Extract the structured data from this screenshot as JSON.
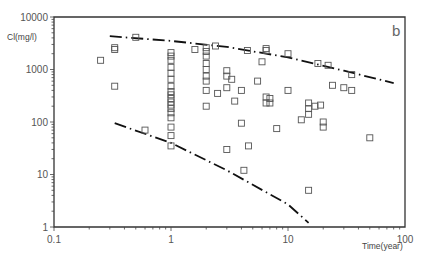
{
  "chart_data": {
    "type": "scatter",
    "title": "",
    "panel_label": "b",
    "xlabel": "Time(year)",
    "ylabel": "Cl(mg/l)",
    "xscale": "log",
    "yscale": "log",
    "xlim": [
      0.1,
      100
    ],
    "ylim": [
      1,
      10000
    ],
    "xticks": [
      "0.1",
      "1",
      "10",
      "100"
    ],
    "yticks": [
      "10000",
      "1000",
      "100",
      "10",
      "1"
    ],
    "grid": false,
    "legend": null,
    "series": [
      {
        "name": "Observed chloride",
        "marker": "open-square",
        "points": [
          [
            0.25,
            1500
          ],
          [
            0.33,
            2600
          ],
          [
            0.33,
            2400
          ],
          [
            0.33,
            480
          ],
          [
            0.5,
            4100
          ],
          [
            0.6,
            70
          ],
          [
            1.0,
            2100
          ],
          [
            1.0,
            1800
          ],
          [
            1.0,
            1500
          ],
          [
            1.0,
            1100
          ],
          [
            1.0,
            850
          ],
          [
            1.0,
            650
          ],
          [
            1.0,
            480
          ],
          [
            1.0,
            380
          ],
          [
            1.0,
            330
          ],
          [
            1.0,
            280
          ],
          [
            1.0,
            240
          ],
          [
            1.0,
            210
          ],
          [
            1.0,
            180
          ],
          [
            1.0,
            150
          ],
          [
            1.0,
            120
          ],
          [
            1.0,
            80
          ],
          [
            1.0,
            55
          ],
          [
            1.0,
            35
          ],
          [
            1.6,
            2400
          ],
          [
            2.0,
            2600
          ],
          [
            2.0,
            2200
          ],
          [
            2.0,
            1800
          ],
          [
            2.0,
            1300
          ],
          [
            2.0,
            1000
          ],
          [
            2.0,
            750
          ],
          [
            2.0,
            600
          ],
          [
            2.0,
            400
          ],
          [
            2.0,
            200
          ],
          [
            2.4,
            2800
          ],
          [
            2.5,
            350
          ],
          [
            3.0,
            950
          ],
          [
            3.0,
            750
          ],
          [
            3.0,
            450
          ],
          [
            3.0,
            30
          ],
          [
            3.3,
            650
          ],
          [
            3.5,
            250
          ],
          [
            4.0,
            400
          ],
          [
            4.0,
            95
          ],
          [
            4.2,
            12
          ],
          [
            4.5,
            2300
          ],
          [
            4.6,
            35
          ],
          [
            5.5,
            600
          ],
          [
            6.0,
            1400
          ],
          [
            6.5,
            2300
          ],
          [
            6.5,
            2500
          ],
          [
            6.5,
            300
          ],
          [
            6.5,
            230
          ],
          [
            7.0,
            230
          ],
          [
            7.0,
            280
          ],
          [
            8.0,
            75
          ],
          [
            10.0,
            2000
          ],
          [
            10.0,
            400
          ],
          [
            13.0,
            110
          ],
          [
            15.0,
            230
          ],
          [
            15.0,
            180
          ],
          [
            15.0,
            140
          ],
          [
            15.0,
            5
          ],
          [
            17.0,
            200
          ],
          [
            18.0,
            1300
          ],
          [
            19.0,
            210
          ],
          [
            20.0,
            100
          ],
          [
            20.0,
            80
          ],
          [
            22.0,
            1200
          ],
          [
            24.0,
            500
          ],
          [
            30.0,
            450
          ],
          [
            35.0,
            800
          ],
          [
            35.0,
            400
          ],
          [
            50.0,
            50
          ]
        ]
      },
      {
        "name": "Upper envelope (dash-dot)",
        "style": "dash-dot",
        "points": [
          [
            0.3,
            4300
          ],
          [
            1.0,
            3500
          ],
          [
            3.0,
            2700
          ],
          [
            10.0,
            1700
          ],
          [
            30.0,
            950
          ],
          [
            80.0,
            550
          ]
        ]
      },
      {
        "name": "Lower envelope (dash-dot)",
        "style": "dash-dot",
        "points": [
          [
            0.33,
            95
          ],
          [
            1.0,
            40
          ],
          [
            3.0,
            12
          ],
          [
            10.0,
            2.7
          ],
          [
            15.0,
            1.2
          ]
        ]
      }
    ]
  },
  "caption": "Figure  Trends of chloride concentration with time"
}
